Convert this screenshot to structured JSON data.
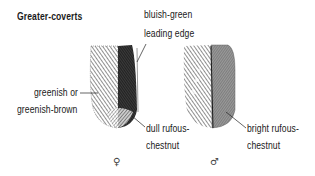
{
  "title": "Greater-coverts",
  "labels": {
    "leading_edge_line1": "bluish-green",
    "leading_edge_line2": "leading edge",
    "outer_web_line1": "greenish or",
    "outer_web_line2": "greenish-brown",
    "female_inner_line1": "dull rufous-",
    "female_inner_line2": "chestnut",
    "male_inner_line1": "bright rufous-",
    "male_inner_line2": "chestnut"
  },
  "symbols": {
    "female": "♀",
    "male": "♂"
  },
  "feathers": [
    {
      "sex": "female",
      "outer_web": "greenish or greenish-brown",
      "leading_edge": "bluish-green",
      "inner_web": "dull rufous-chestnut"
    },
    {
      "sex": "male",
      "inner_web": "bright rufous-chestnut"
    }
  ],
  "colors": {
    "ink": "#1a1a1a",
    "background": "#ffffff"
  }
}
